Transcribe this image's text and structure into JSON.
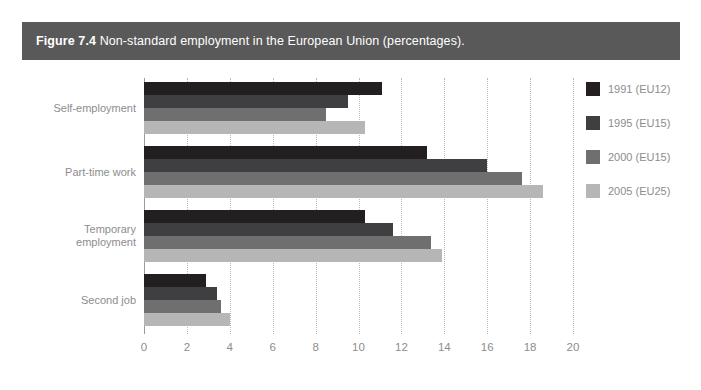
{
  "caption": {
    "figure_number": "Figure 7.4",
    "text": "Non-standard employment in the European Union (percentages).",
    "band_color": "#595959"
  },
  "chart_data": {
    "type": "bar",
    "orientation": "horizontal",
    "title": "Non-standard employment in the European Union (percentages).",
    "xlabel": "",
    "ylabel": "",
    "xlim": [
      0,
      20
    ],
    "xticks": [
      0,
      2,
      4,
      6,
      8,
      10,
      12,
      14,
      16,
      18,
      20
    ],
    "xtick_labels": [
      "0",
      "2",
      "4",
      "6",
      "8",
      "10",
      "12",
      "14",
      "16",
      "18",
      "20"
    ],
    "grid": "vertical-dotted",
    "legend_position": "right",
    "categories": [
      "Self-employment",
      "Part-time work",
      "Temporary employment",
      "Second job"
    ],
    "series": [
      {
        "name": "1991 (EU12)",
        "color": "#231f20",
        "values": [
          11.1,
          13.2,
          10.3,
          2.9
        ]
      },
      {
        "name": "1995 (EU15)",
        "color": "#3f3f41",
        "values": [
          9.5,
          16.0,
          11.6,
          3.4
        ]
      },
      {
        "name": "2000 (EU15)",
        "color": "#6f6f6f",
        "values": [
          8.5,
          17.6,
          13.4,
          3.6
        ]
      },
      {
        "name": "2005 (EU25)",
        "color": "#b6b6b6",
        "values": [
          10.3,
          18.6,
          13.9,
          4.0
        ]
      }
    ]
  }
}
